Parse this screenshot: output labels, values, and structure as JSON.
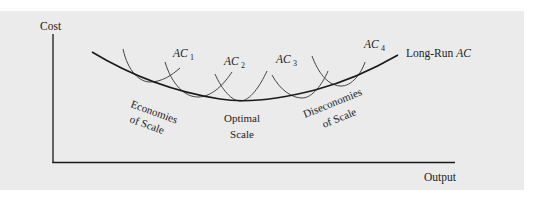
{
  "diagram": {
    "title": "",
    "axes": {
      "y_label": "Cost",
      "x_label": "Output"
    },
    "curves": {
      "long_run": {
        "prefix": "Long-Run ",
        "italic": "AC"
      },
      "short_run": [
        {
          "base": "AC",
          "sub": "1"
        },
        {
          "base": "AC",
          "sub": "2"
        },
        {
          "base": "AC",
          "sub": "3"
        },
        {
          "base": "AC",
          "sub": "4"
        }
      ]
    },
    "regions": {
      "economies_line1": "Economies",
      "economies_line2": "of Scale",
      "optimal_line1": "Optimal",
      "optimal_line2": "Scale",
      "diseconomies_line1": "Diseconomies",
      "diseconomies_line2": "of Scale"
    },
    "colors": {
      "panel_bg": "#ebebeb",
      "long_run_curve": "#1a1a1a",
      "short_run_curves": "#444444",
      "axis": "#1a1a1a"
    }
  }
}
